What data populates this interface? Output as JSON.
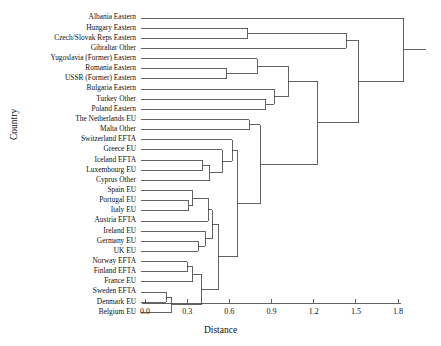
{
  "figure": {
    "kind": "dendrogram",
    "xlabel": "Distance",
    "ylabel": "Country",
    "background": "#ffffff",
    "line_color": "#3a3a3a"
  },
  "axis": {
    "ticks": [
      "0.0",
      "0.3",
      "0.6",
      "0.9",
      "1.2",
      "1.5",
      "1.8"
    ],
    "tick_values": [
      0.0,
      0.3,
      0.6,
      0.9,
      1.2,
      1.5,
      1.8
    ],
    "xlim": [
      0.0,
      1.8
    ]
  },
  "chart_data": {
    "type": "line",
    "title": "",
    "xlabel": "Distance",
    "ylabel": "Country",
    "xlim": [
      0.0,
      1.8
    ],
    "grid": false,
    "legend": "none",
    "leaves": [
      "Albania Eastern",
      "Hungary Eastern",
      "Czech/Slovak Reps Eastern",
      "Gibraltar Other",
      "Yugoslavia (Former) Eastern",
      "Romania Eastern",
      "USSR (Former) Eastern",
      "Bulgaria Eastern",
      "Turkey Other",
      "Poland Eastern",
      "The Netherlands EU",
      "Malta Other",
      "Switzerland EFTA",
      "Greece EU",
      "Iceland EFTA",
      "Luxembourg EU",
      "Cyprus Other",
      "Spain EU",
      "Portugal EU",
      "Italy EU",
      "Austria EFTA",
      "Ireland EU",
      "Germany EU",
      "UK EU",
      "Norway EFTA",
      "Finland EFTA",
      "France EU",
      "Sweden EFTA",
      "Denmark EU",
      "Belgium EU"
    ],
    "merges": [
      {
        "id": "m1",
        "left": "Sweden EFTA",
        "right": "Denmark EU",
        "distance": 0.15
      },
      {
        "id": "m2",
        "left": "m1",
        "right": "Belgium EU",
        "distance": 0.19
      },
      {
        "id": "m3",
        "left": "Norway EFTA",
        "right": "Finland EFTA",
        "distance": 0.3
      },
      {
        "id": "m4",
        "left": "m3",
        "right": "France EU",
        "distance": 0.34
      },
      {
        "id": "m5",
        "left": "m4",
        "right": "m2",
        "distance": 0.4
      },
      {
        "id": "m6",
        "left": "Germany EU",
        "right": "UK EU",
        "distance": 0.38
      },
      {
        "id": "m7",
        "left": "Ireland EU",
        "right": "m6",
        "distance": 0.43
      },
      {
        "id": "m8",
        "left": "Portugal EU",
        "right": "Italy EU",
        "distance": 0.31
      },
      {
        "id": "m9",
        "left": "Spain EU",
        "right": "m8",
        "distance": 0.34
      },
      {
        "id": "m10",
        "left": "m9",
        "right": "Austria EFTA",
        "distance": 0.45
      },
      {
        "id": "m11",
        "left": "m10",
        "right": "m7",
        "distance": 0.48
      },
      {
        "id": "m12",
        "left": "m11",
        "right": "m5",
        "distance": 0.52
      },
      {
        "id": "m13",
        "left": "Iceland EFTA",
        "right": "Luxembourg EU",
        "distance": 0.41
      },
      {
        "id": "m14",
        "left": "m13",
        "right": "Cyprus Other",
        "distance": 0.46
      },
      {
        "id": "m15",
        "left": "Greece EU",
        "right": "m14",
        "distance": 0.55
      },
      {
        "id": "m16",
        "left": "Switzerland EFTA",
        "right": "m15",
        "distance": 0.62
      },
      {
        "id": "m17",
        "left": "m16",
        "right": "m12",
        "distance": 0.66
      },
      {
        "id": "m18",
        "left": "The Netherlands EU",
        "right": "Malta Other",
        "distance": 0.74
      },
      {
        "id": "m19",
        "left": "m18",
        "right": "m17",
        "distance": 0.82
      },
      {
        "id": "m20",
        "left": "Turkey Other",
        "right": "Poland Eastern",
        "distance": 0.86
      },
      {
        "id": "m21",
        "left": "Bulgaria Eastern",
        "right": "m20",
        "distance": 0.92
      },
      {
        "id": "m22",
        "left": "Romania Eastern",
        "right": "USSR (Former) Eastern",
        "distance": 0.58
      },
      {
        "id": "m23",
        "left": "Yugoslavia (Former) Eastern",
        "right": "m22",
        "distance": 0.8
      },
      {
        "id": "m24",
        "left": "m23",
        "right": "m21",
        "distance": 1.02
      },
      {
        "id": "m25",
        "left": "m24",
        "right": "m19",
        "distance": 1.23
      },
      {
        "id": "m26",
        "left": "Hungary Eastern",
        "right": "Czech/Slovak Reps Eastern",
        "distance": 0.73
      },
      {
        "id": "m27",
        "left": "m26",
        "right": "Gibraltar Other",
        "distance": 1.43
      },
      {
        "id": "m28",
        "left": "m27",
        "right": "m25",
        "distance": 1.52
      },
      {
        "id": "m29",
        "left": "Albania Eastern",
        "right": "m28",
        "distance": 1.84
      }
    ]
  }
}
